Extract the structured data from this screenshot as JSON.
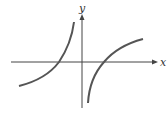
{
  "diagram": {
    "type": "function-graph-sketch",
    "axes": {
      "x_label": "x",
      "y_label": "y",
      "color": "#444444"
    },
    "curves": [
      {
        "name": "left-branch",
        "description": "increasing curve left of y-axis, crossing x-axis at negative x, rising steeply toward the y-axis",
        "color": "#555555"
      },
      {
        "name": "right-branch",
        "description": "increasing curve right of y-axis, rising from below near the y-axis, crossing x-axis at positive x, flattening out to the right",
        "color": "#555555"
      }
    ]
  }
}
